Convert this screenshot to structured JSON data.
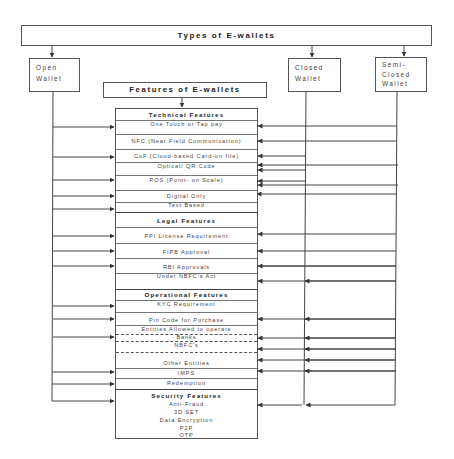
{
  "banner": {
    "title": "Types of E-wallets"
  },
  "wallets": [
    {
      "id": "open",
      "label_lines": [
        "Open",
        "Wallet"
      ]
    },
    {
      "id": "closed",
      "label_lines": [
        "Closed",
        "Wallet"
      ]
    },
    {
      "id": "semi_closed",
      "label_lines": [
        "Semi-",
        "Closed",
        "Wallet"
      ]
    }
  ],
  "features_title": "Features of E-wallets",
  "sections": {
    "technical": {
      "header": "Technical Features",
      "items": [
        "One Touch or Tap pay",
        "NFC (Near Field Communication)",
        "CoF (Cloud-based Card-on file)",
        "Optical/ QR Code",
        "POS (Point- on Scale)",
        "Digital Only",
        "Text Based"
      ]
    },
    "legal": {
      "header": "Legal Features",
      "items": [
        "PPI License Requirement",
        "FIPB Approval",
        "RBI Approvals",
        "Under NBFC's Act"
      ]
    },
    "operational": {
      "header": "Operational Features",
      "items": [
        "KYC Requirement",
        "Pin Code for Purchase",
        "Entities Allowed to operate",
        "Banks",
        "NBFC's",
        "Other Entities",
        "IMPS",
        "Redemption"
      ]
    },
    "security": {
      "header": "Security Features",
      "items": [
        "Anti-Fraud",
        "3D SET",
        "Data Encryption",
        "P2P",
        "OTP"
      ]
    }
  },
  "colors": {
    "line": "#444444",
    "box_border": "#555555",
    "text": "#333333"
  }
}
